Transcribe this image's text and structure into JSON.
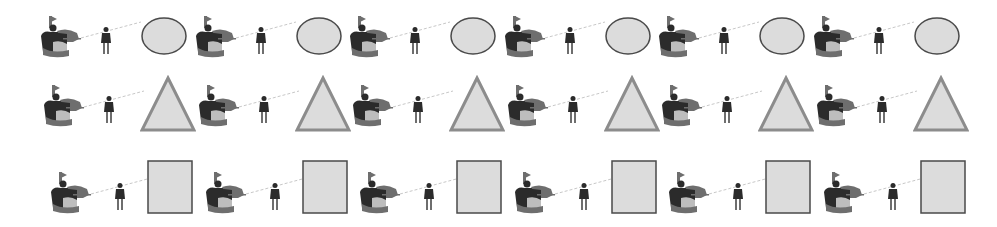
{
  "scene": {
    "background": "#ffffff",
    "colors": {
      "figure_dark": "#2b2b2b",
      "figure_mid": "#6e6e6e",
      "figure_light": "#bdbdbd",
      "shape_fill": "#dcdcdc",
      "shape_stroke_dark": "#4a4a4a",
      "shape_stroke_triangle": "#8c8c8c",
      "lance": "#c8c8c8"
    },
    "rows": [
      {
        "shape": "ellipse",
        "units": 6
      },
      {
        "shape": "triangle",
        "units": 6
      },
      {
        "shape": "rectangle",
        "units": 6
      }
    ],
    "unit_elements": [
      "cavalry-rider-icon",
      "foot-soldier-icon",
      "lance-line",
      "shape"
    ]
  }
}
